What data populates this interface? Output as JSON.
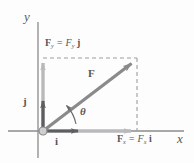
{
  "figure": {
    "axes": {
      "y_label": "y",
      "x_label": "x"
    },
    "labels": {
      "fy_component": "F",
      "fy_sub": "y",
      "fy_equals": " = F",
      "fy_sub2": "y",
      "fy_unit": " j",
      "fx_component": "F",
      "fx_sub": "x",
      "fx_equals": " = F",
      "fx_sub2": "x",
      "fx_unit": " i",
      "force_vector": "F",
      "unit_i": "i",
      "unit_j": "j",
      "angle": "θ"
    },
    "colors": {
      "axis": "#8b8b8d",
      "component_arrow": "#b9b9bb",
      "force_vector": "#8a8a8c",
      "unit_vector": "#5e5e60",
      "dashed": "#9d9d9f",
      "text": "#58585a",
      "background": "#fdfdfd"
    },
    "geometry": {
      "origin_x": 43,
      "origin_y": 131,
      "tip_x": 137,
      "tip_y": 58,
      "x_axis_end": 172,
      "y_axis_top": 22,
      "angle_degrees": 38
    }
  }
}
